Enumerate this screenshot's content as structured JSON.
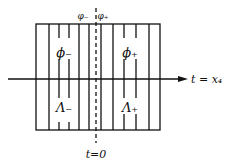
{
  "diagram": {
    "labels": {
      "top_left": "φ₋",
      "top_right": "φ₊",
      "region_left_upper": "ϕ₋",
      "region_right_upper": "ϕ₊",
      "region_left_lower": "Λ₋",
      "region_right_lower": "Λ₊",
      "axis": "t = x₄",
      "origin": "t=0"
    },
    "colors": {
      "ink": "#111111",
      "background": "#ffffff"
    }
  }
}
